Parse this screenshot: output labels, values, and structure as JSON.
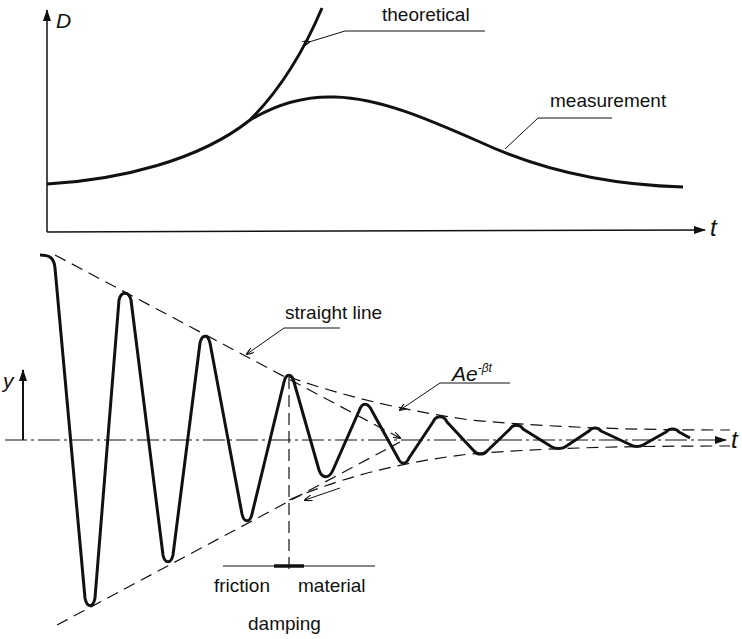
{
  "top_chart": {
    "y_axis_label": "D",
    "x_axis_label": "t",
    "curves": [
      {
        "name": "theoretical",
        "label": "theoretical"
      },
      {
        "name": "measurement",
        "label": "measurement"
      }
    ]
  },
  "bottom_chart": {
    "y_axis_label": "y",
    "x_axis_label": "t",
    "annotations": {
      "straight_line": "straight line",
      "exponential_prefix": "Ae",
      "exponential_exponent": "-βt",
      "friction": "friction",
      "material": "material",
      "damping": "damping"
    }
  },
  "colors": {
    "ink": "#111111",
    "background": "#ffffff"
  }
}
